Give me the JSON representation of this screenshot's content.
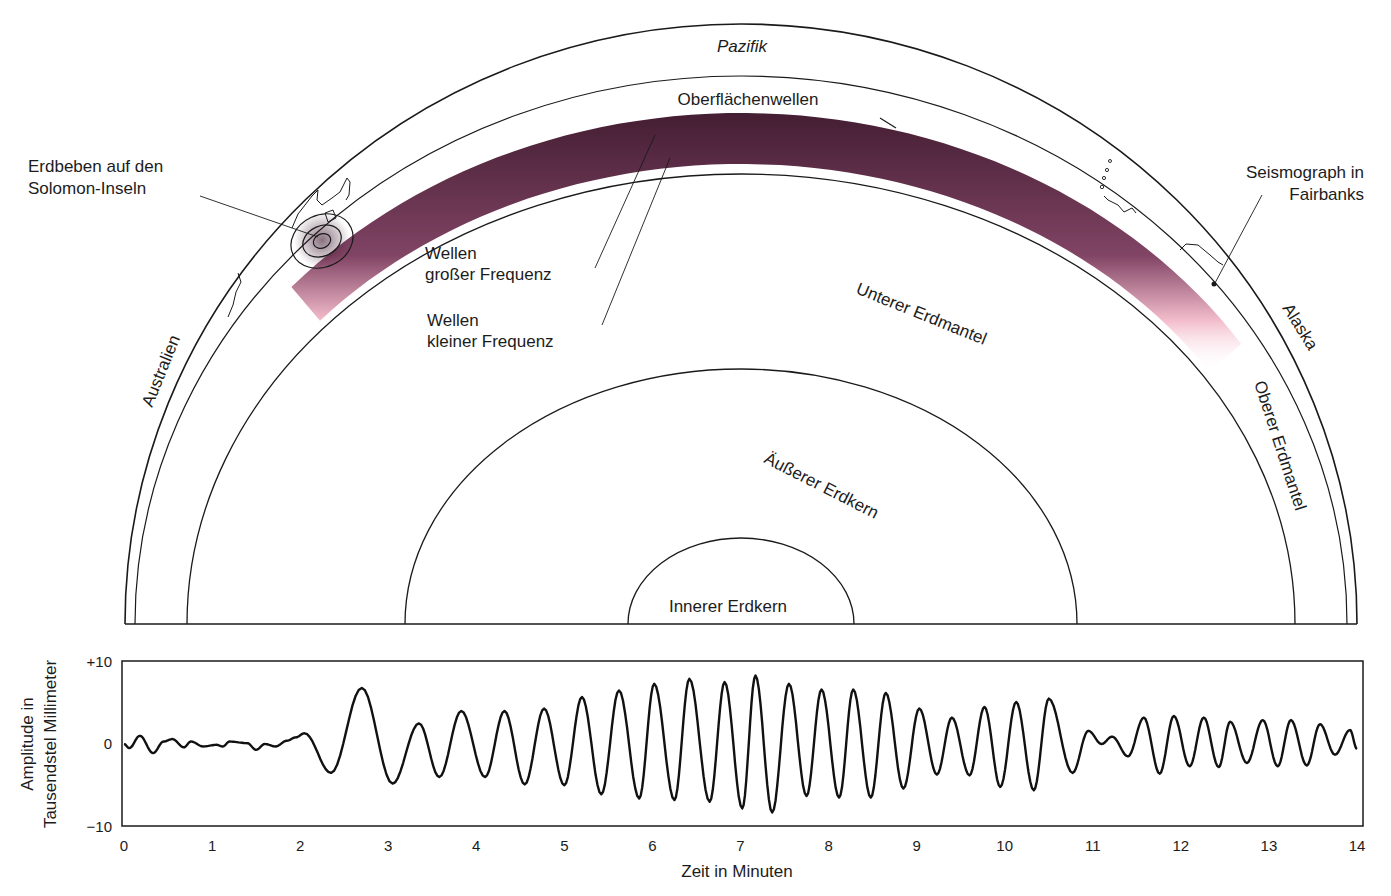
{
  "diagram": {
    "labels": {
      "ocean": "Pazifik",
      "surface_waves": "Oberflächenwellen",
      "quake_line1": "Erdbeben auf den",
      "quake_line2": "Solomon-Inseln",
      "seismo_line1": "Seismograph in",
      "seismo_line2": "Fairbanks",
      "high_freq_line1": "Wellen",
      "high_freq_line2": "großer Frequenz",
      "low_freq_line1": "Wellen",
      "low_freq_line2": "kleiner Frequenz",
      "lower_mantle": "Unterer Erdmantel",
      "upper_mantle": "Oberer Erdmantel",
      "outer_core": "Äußerer Erdkern",
      "inner_core": "Innerer Erdkern",
      "australia": "Australien",
      "alaska": "Alaska"
    },
    "colors": {
      "wave_dark": "#3a1228",
      "wave_mid": "#7a3a5c",
      "wave_light": "#f2b8c8",
      "line": "#1a1a1a"
    }
  },
  "chart_data": {
    "type": "line",
    "title": "",
    "xlabel": "Zeit in Minuten",
    "ylabel_line1": "Amplitude in",
    "ylabel_line2": "Tausendstel Millimeter",
    "xlim": [
      0,
      14
    ],
    "ylim": [
      -10,
      10
    ],
    "x_ticks": [
      "0",
      "1",
      "2",
      "3",
      "4",
      "5",
      "6",
      "7",
      "8",
      "9",
      "10",
      "11",
      "12",
      "13",
      "14"
    ],
    "y_ticks": [
      {
        "value": 10,
        "label": "+10"
      },
      {
        "value": 0,
        "label": "0"
      },
      {
        "value": -10,
        "label": "−10"
      }
    ],
    "grid": false,
    "series": [
      {
        "name": "Seismogramm Fairbanks",
        "extrema": [
          [
            0.0,
            0.0
          ],
          [
            0.06,
            -0.5
          ],
          [
            0.18,
            1.0
          ],
          [
            0.33,
            -1.1
          ],
          [
            0.45,
            0.3
          ],
          [
            0.55,
            0.6
          ],
          [
            0.68,
            -0.4
          ],
          [
            0.76,
            0.3
          ],
          [
            0.9,
            -0.3
          ],
          [
            1.05,
            -0.1
          ],
          [
            1.12,
            -0.3
          ],
          [
            1.2,
            0.3
          ],
          [
            1.4,
            0.1
          ],
          [
            1.5,
            -0.7
          ],
          [
            1.6,
            0.0
          ],
          [
            1.72,
            -0.3
          ],
          [
            1.85,
            0.4
          ],
          [
            1.95,
            0.8
          ],
          [
            2.05,
            1.3
          ],
          [
            2.35,
            -3.5
          ],
          [
            2.7,
            6.8
          ],
          [
            3.05,
            -4.8
          ],
          [
            3.35,
            2.5
          ],
          [
            3.58,
            -4.0
          ],
          [
            3.83,
            4.0
          ],
          [
            4.1,
            -4.0
          ],
          [
            4.32,
            4.0
          ],
          [
            4.55,
            -4.9
          ],
          [
            4.77,
            4.3
          ],
          [
            5.0,
            -5.0
          ],
          [
            5.2,
            5.7
          ],
          [
            5.42,
            -6.1
          ],
          [
            5.62,
            6.5
          ],
          [
            5.85,
            -6.6
          ],
          [
            6.02,
            7.3
          ],
          [
            6.25,
            -6.8
          ],
          [
            6.42,
            7.9
          ],
          [
            6.65,
            -7.0
          ],
          [
            6.82,
            7.5
          ],
          [
            7.02,
            -7.8
          ],
          [
            7.17,
            8.3
          ],
          [
            7.36,
            -8.3
          ],
          [
            7.55,
            7.3
          ],
          [
            7.75,
            -6.3
          ],
          [
            7.92,
            6.6
          ],
          [
            8.12,
            -6.5
          ],
          [
            8.28,
            6.6
          ],
          [
            8.48,
            -6.5
          ],
          [
            8.65,
            6.2
          ],
          [
            8.85,
            -5.4
          ],
          [
            9.03,
            4.3
          ],
          [
            9.23,
            -3.7
          ],
          [
            9.4,
            3.2
          ],
          [
            9.6,
            -3.8
          ],
          [
            9.77,
            4.5
          ],
          [
            9.95,
            -5.2
          ],
          [
            10.13,
            5.1
          ],
          [
            10.33,
            -5.6
          ],
          [
            10.5,
            5.5
          ],
          [
            10.77,
            -3.5
          ],
          [
            10.95,
            1.6
          ],
          [
            11.1,
            0.0
          ],
          [
            11.22,
            0.9
          ],
          [
            11.4,
            -1.5
          ],
          [
            11.58,
            3.2
          ],
          [
            11.76,
            -3.6
          ],
          [
            11.92,
            3.4
          ],
          [
            12.1,
            -2.7
          ],
          [
            12.26,
            3.2
          ],
          [
            12.43,
            -2.8
          ],
          [
            12.56,
            2.7
          ],
          [
            12.75,
            -2.3
          ],
          [
            12.93,
            2.9
          ],
          [
            13.1,
            -2.7
          ],
          [
            13.25,
            2.9
          ],
          [
            13.43,
            -2.6
          ],
          [
            13.58,
            2.4
          ],
          [
            13.75,
            -1.3
          ],
          [
            13.92,
            1.7
          ],
          [
            14.0,
            -0.6
          ]
        ]
      }
    ]
  }
}
